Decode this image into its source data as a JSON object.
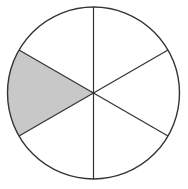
{
  "diagram": {
    "type": "fraction-circle",
    "total_parts": 6,
    "shaded_parts": 1,
    "fraction": "1/6",
    "center": [
      93.5,
      93
    ],
    "radius": 86,
    "shaded_sector": {
      "start_angle_deg": 150,
      "end_angle_deg": 210
    },
    "spoke_angles_deg": [
      90,
      30,
      -30,
      -90,
      -150,
      150
    ],
    "colors": {
      "background": "#ffffff",
      "stroke": "#333333",
      "shaded_fill": "#c8c8c8",
      "unshaded_fill": "#ffffff"
    }
  }
}
